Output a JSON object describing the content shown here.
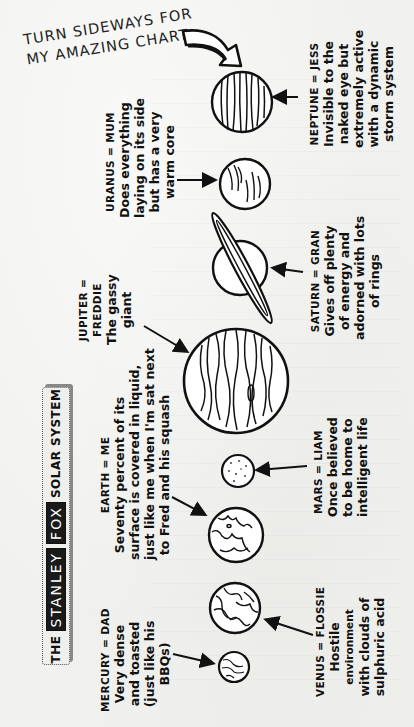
{
  "title": {
    "prefix": "THE",
    "name_first": "STANLEY",
    "name_last": "FOX",
    "suffix": "SOLAR SYSTEM"
  },
  "instruction": {
    "line1": "TURN SIDEWAYS FOR",
    "line2": "MY AMAZING CHART",
    "icon": "curved-arrow-icon"
  },
  "planets": [
    {
      "planet": "MERCURY",
      "person": "DAD",
      "label": "MERCURY = DAD",
      "lines": [
        "Very dense",
        "and toasted",
        "(just like his",
        "BBQs)"
      ]
    },
    {
      "planet": "VENUS",
      "person": "FLOSSIE",
      "label": "VENUS = FLOSSIE",
      "lines": [
        "Hostile",
        "environment",
        "with clouds of",
        "sulphuric acid"
      ]
    },
    {
      "planet": "EARTH",
      "person": "ME",
      "label": "EARTH = ME",
      "lines": [
        "Seventy percent of its",
        "surface is covered in liquid,",
        "just like me when I'm sat next",
        "to Fred and his squash"
      ]
    },
    {
      "planet": "MARS",
      "person": "LIAM",
      "label": "MARS = LIAM",
      "lines": [
        "Once believed",
        "to be home to",
        "intelligent life"
      ]
    },
    {
      "planet": "JUPITER",
      "person": "FREDDIE",
      "label": "JUPITER =",
      "label2": "FREDDIE",
      "lines": [
        "The gassy",
        "giant"
      ]
    },
    {
      "planet": "SATURN",
      "person": "GRAN",
      "label": "SATURN = GRAN",
      "lines": [
        "Gives off plenty",
        "of energy and",
        "adorned with lots",
        "of rings"
      ]
    },
    {
      "planet": "URANUS",
      "person": "MUM",
      "label": "URANUS = MUM",
      "lines": [
        "Does everything",
        "laying on its side",
        "but has a very",
        "warm core"
      ]
    },
    {
      "planet": "NEPTUNE",
      "person": "JESS",
      "label": "NEPTUNE = JESS",
      "lines": [
        "Invisible to the",
        "naked eye but",
        "extremely active",
        "with a dynamic",
        "storm system"
      ]
    }
  ],
  "colors": {
    "paper": "#f1f1ef",
    "ink": "#111111",
    "banner_highlight": "#1a1a1a"
  }
}
